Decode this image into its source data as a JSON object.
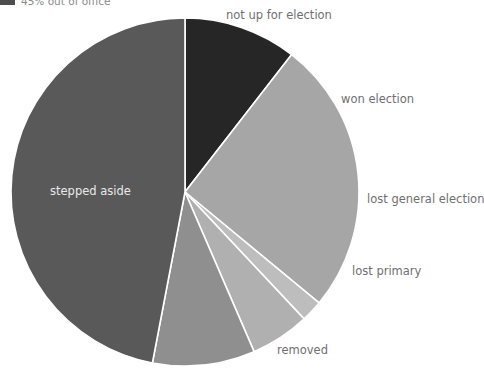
{
  "legend": {
    "swatch_color": "#4d4d4d",
    "label": "45% out of office"
  },
  "chart_data": {
    "type": "pie",
    "title": "",
    "subtitle": "",
    "xlabel": "",
    "ylabel": "",
    "legend_position": "top-left",
    "grid": false,
    "start_angle_deg": 0,
    "direction": "clockwise",
    "center": {
      "x": 185,
      "y": 192
    },
    "radius": 174,
    "separator_color": "#ffffff",
    "categories": [
      "not up for election",
      "won election",
      "lost general election",
      "lost primary",
      "removed",
      "stepped aside"
    ],
    "values": [
      10.5,
      25.5,
      2.0,
      5.5,
      9.5,
      47.0
    ],
    "unit": "%",
    "slices": [
      {
        "label": "not up for election",
        "value": 10.5,
        "color": "#262626",
        "start_deg": 0,
        "end_deg": 37.8,
        "label_position": "outside-top",
        "label_color": "#6f6f6f"
      },
      {
        "label": "won election",
        "value": 25.5,
        "color": "#a6a6a6",
        "start_deg": 37.8,
        "end_deg": 129.6,
        "label_position": "outside-right",
        "label_color": "#6f6f6f"
      },
      {
        "label": "lost general election",
        "value": 2.0,
        "color": "#bdbdbd",
        "start_deg": 129.6,
        "end_deg": 136.8,
        "label_position": "outside-right",
        "label_color": "#6f6f6f"
      },
      {
        "label": "lost primary",
        "value": 5.5,
        "color": "#b0b0b0",
        "start_deg": 136.8,
        "end_deg": 156.6,
        "label_position": "outside-lower-right",
        "label_color": "#6f6f6f"
      },
      {
        "label": "removed",
        "value": 9.5,
        "color": "#8f8f8f",
        "start_deg": 156.6,
        "end_deg": 190.8,
        "label_position": "outside-bottom",
        "label_color": "#6f6f6f"
      },
      {
        "label": "stepped aside",
        "value": 47.0,
        "color": "#595959",
        "start_deg": 190.8,
        "end_deg": 360.0,
        "label_position": "inside-left",
        "label_color": "#e9e9e9"
      }
    ]
  }
}
